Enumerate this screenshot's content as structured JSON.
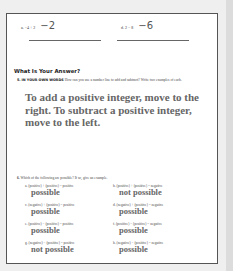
{
  "exercises": [
    {
      "label": "a.",
      "expr": "−4 + 2",
      "answer": "−2"
    },
    {
      "label": "d.",
      "expr": "2 − 8",
      "answer": "−6"
    }
  ],
  "section": {
    "title": "What Is Your Answer?"
  },
  "question5": {
    "number": "5.",
    "lead": "IN YOUR OWN WORDS",
    "text": "How can you use a number line to add and subtract? Write two examples of each.",
    "answer": "To add a positive integer, move to the right. To subtract a positive integer, move to the left."
  },
  "question6": {
    "number": "6.",
    "text": "Which of the following are possible? If so, give an example.",
    "items": [
      {
        "label": "a.",
        "statement": "(positive) + (positive) = positive",
        "result": "possible"
      },
      {
        "label": "b.",
        "statement": "(positive) + (positive) = negative",
        "result": "not possible"
      },
      {
        "label": "c.",
        "statement": "(negative) + (positive) = positive",
        "result": "possible"
      },
      {
        "label": "d.",
        "statement": "(negative) + (positive) = negative",
        "result": "possible"
      },
      {
        "label": "e.",
        "statement": "(positive) − (positive) = positive",
        "result": "possible"
      },
      {
        "label": "f.",
        "statement": "(positive) − (positive) = negative",
        "result": "possible"
      },
      {
        "label": "g.",
        "statement": "(negative) − (positive) = positive",
        "result": "not possible"
      },
      {
        "label": "h.",
        "statement": "(negative) − (positive) = negative",
        "result": "possible"
      }
    ]
  }
}
